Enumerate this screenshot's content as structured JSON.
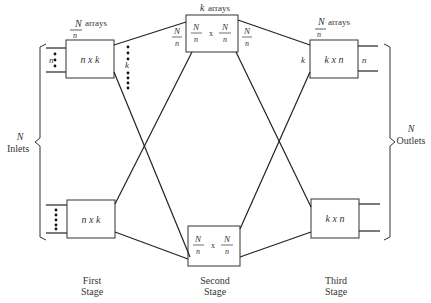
{
  "diagram": {
    "type": "three-stage switching network",
    "stages": [
      {
        "name": "First Stage",
        "label_line1": "First",
        "label_line2": "Stage",
        "array_count_label": {
          "numerator": "N",
          "denominator": "n",
          "suffix": "arrays"
        },
        "box_label": "n x k",
        "input_label": "n",
        "output_label": "k"
      },
      {
        "name": "Second Stage",
        "label_line1": "Second",
        "label_line2": "Stage",
        "array_count_label": {
          "prefix": "k",
          "suffix": "arrays"
        },
        "box_label": {
          "left": {
            "numerator": "N",
            "denominator": "n"
          },
          "times": "x",
          "right": {
            "numerator": "N",
            "denominator": "n"
          }
        },
        "input_label": {
          "numerator": "N",
          "denominator": "n"
        },
        "output_label": {
          "numerator": "N",
          "denominator": "n"
        }
      },
      {
        "name": "Third Stage",
        "label_line1": "Third",
        "label_line2": "Stage",
        "array_count_label": {
          "numerator": "N",
          "denominator": "n",
          "suffix": "arrays"
        },
        "box_label": "k x n",
        "input_label": "k",
        "output_label": "n"
      }
    ],
    "inlets": {
      "count": "N",
      "label": "Inlets"
    },
    "outlets": {
      "count": "N",
      "label": "Outlets"
    },
    "times_symbol": "x",
    "colors": {
      "line": "#222222",
      "text": "#333333",
      "background": "#ffffff"
    }
  }
}
